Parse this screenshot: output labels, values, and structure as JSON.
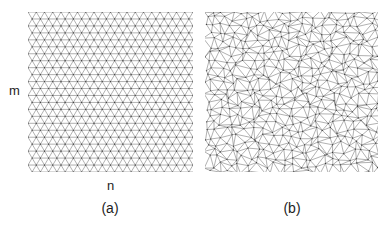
{
  "figure": {
    "background_color": "#ffffff",
    "line_color": "#6f6f6f",
    "node_color": "#3a3a3a",
    "text_color": "#1d1d1d"
  },
  "axis_labels": {
    "vertical": "m",
    "horizontal": "n"
  },
  "panels": [
    {
      "id": "a",
      "caption": "(a)",
      "mesh_type": "structured-triangular-grid",
      "columns": 20,
      "rows": 23,
      "jitter": 0.0,
      "x": 28,
      "y": 12,
      "width": 165,
      "height": 160
    },
    {
      "id": "b",
      "caption": "(b)",
      "mesh_type": "unstructured-triangulation",
      "columns": 20,
      "rows": 23,
      "jitter": 0.46,
      "x": 205,
      "y": 12,
      "width": 173,
      "height": 160
    }
  ]
}
